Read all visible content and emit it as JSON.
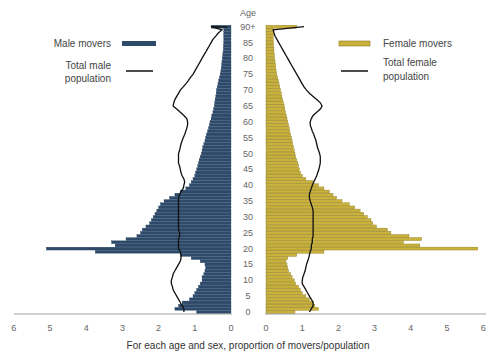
{
  "chart_data": {
    "type": "bar",
    "subtype": "population-pyramid",
    "title": "",
    "ylabel": "Age",
    "xlabel": "For each age and sex, proportion of movers/population",
    "age_ticks": [
      "0",
      "5",
      "10",
      "15",
      "20",
      "25",
      "30",
      "35",
      "40",
      "45",
      "50",
      "55",
      "60",
      "65",
      "70",
      "75",
      "80",
      "85",
      "90+"
    ],
    "x_ticks_left": [
      "6",
      "5",
      "4",
      "3",
      "2",
      "1",
      "0"
    ],
    "x_ticks_right": [
      "0",
      "1",
      "2",
      "3",
      "4",
      "5",
      "6"
    ],
    "xlim": [
      0,
      6
    ],
    "legend": {
      "male_movers": "Male movers",
      "total_male": "Total male population",
      "total_male_line1": "Total male",
      "total_male_line2": "population",
      "female_movers": "Female movers",
      "total_female": "Total female population",
      "total_female_line1": "Total female",
      "total_female_line2": "population"
    },
    "colors": {
      "male": "#2e4a6b",
      "female": "#c9b13c",
      "female_edge": "#8a7a20",
      "line": "#111111",
      "axis": "#888888"
    },
    "ages": [
      0,
      1,
      2,
      3,
      4,
      5,
      6,
      7,
      8,
      9,
      10,
      11,
      12,
      13,
      14,
      15,
      16,
      17,
      18,
      19,
      20,
      21,
      22,
      23,
      24,
      25,
      26,
      27,
      28,
      29,
      30,
      31,
      32,
      33,
      34,
      35,
      36,
      37,
      38,
      39,
      40,
      41,
      42,
      43,
      44,
      45,
      46,
      47,
      48,
      49,
      50,
      51,
      52,
      53,
      54,
      55,
      56,
      57,
      58,
      59,
      60,
      61,
      62,
      63,
      64,
      65,
      66,
      67,
      68,
      69,
      70,
      71,
      72,
      73,
      74,
      75,
      76,
      77,
      78,
      79,
      80,
      81,
      82,
      83,
      84,
      85,
      86,
      87,
      88,
      89,
      90
    ],
    "series": [
      {
        "name": "Male movers",
        "values": [
          0.95,
          1.55,
          1.45,
          1.35,
          1.15,
          1.05,
          1.0,
          0.95,
          0.9,
          0.85,
          0.8,
          0.8,
          0.75,
          0.72,
          0.7,
          0.72,
          0.85,
          1.1,
          1.4,
          3.75,
          5.1,
          3.2,
          3.3,
          2.9,
          2.6,
          2.5,
          2.45,
          2.35,
          2.25,
          2.2,
          2.15,
          2.1,
          2.05,
          2.0,
          1.95,
          1.85,
          1.7,
          1.55,
          1.4,
          1.25,
          1.15,
          1.1,
          1.05,
          1.0,
          0.98,
          0.95,
          0.92,
          0.9,
          0.88,
          0.85,
          0.82,
          0.8,
          0.78,
          0.75,
          0.72,
          0.7,
          0.68,
          0.65,
          0.62,
          0.6,
          0.58,
          0.55,
          0.53,
          0.5,
          0.48,
          0.46,
          0.45,
          0.44,
          0.42,
          0.41,
          0.4,
          0.38,
          0.36,
          0.34,
          0.32,
          0.3,
          0.28,
          0.27,
          0.26,
          0.25,
          0.24,
          0.23,
          0.22,
          0.21,
          0.21,
          0.2,
          0.2,
          0.2,
          0.2,
          0.2,
          0.55
        ]
      },
      {
        "name": "Female movers",
        "values": [
          0.8,
          1.45,
          1.35,
          1.3,
          1.2,
          1.1,
          1.0,
          0.95,
          0.9,
          0.82,
          0.78,
          0.72,
          0.68,
          0.62,
          0.6,
          0.58,
          0.55,
          0.6,
          0.85,
          1.6,
          5.85,
          4.25,
          3.8,
          4.3,
          3.95,
          3.45,
          3.35,
          3.05,
          2.95,
          2.9,
          2.8,
          2.7,
          2.6,
          2.45,
          2.3,
          2.1,
          1.95,
          1.85,
          1.75,
          1.6,
          1.45,
          1.3,
          1.1,
          1.0,
          0.95,
          0.92,
          0.9,
          0.88,
          0.85,
          0.82,
          0.8,
          0.78,
          0.76,
          0.74,
          0.72,
          0.7,
          0.68,
          0.66,
          0.64,
          0.62,
          0.6,
          0.58,
          0.56,
          0.54,
          0.52,
          0.5,
          0.48,
          0.46,
          0.44,
          0.42,
          0.4,
          0.38,
          0.36,
          0.34,
          0.32,
          0.3,
          0.28,
          0.27,
          0.26,
          0.25,
          0.24,
          0.23,
          0.22,
          0.22,
          0.21,
          0.21,
          0.2,
          0.2,
          0.2,
          0.2,
          0.85
        ]
      },
      {
        "name": "Total male population",
        "type": "line",
        "values": [
          1.3,
          1.3,
          1.35,
          1.4,
          1.45,
          1.5,
          1.55,
          1.6,
          1.62,
          1.65,
          1.65,
          1.62,
          1.6,
          1.55,
          1.5,
          1.45,
          1.4,
          1.38,
          1.38,
          1.4,
          1.45,
          1.45,
          1.45,
          1.45,
          1.42,
          1.42,
          1.45,
          1.45,
          1.45,
          1.45,
          1.45,
          1.45,
          1.45,
          1.45,
          1.45,
          1.45,
          1.45,
          1.42,
          1.38,
          1.32,
          1.3,
          1.28,
          1.3,
          1.35,
          1.38,
          1.4,
          1.42,
          1.45,
          1.45,
          1.45,
          1.45,
          1.42,
          1.4,
          1.38,
          1.35,
          1.32,
          1.28,
          1.25,
          1.22,
          1.2,
          1.2,
          1.22,
          1.3,
          1.4,
          1.5,
          1.6,
          1.58,
          1.55,
          1.5,
          1.45,
          1.4,
          1.32,
          1.25,
          1.18,
          1.12,
          1.05,
          1.0,
          0.95,
          0.9,
          0.85,
          0.8,
          0.75,
          0.7,
          0.65,
          0.6,
          0.55,
          0.5,
          0.42,
          0.35,
          0.25,
          0.55
        ]
      },
      {
        "name": "Total female population",
        "type": "line",
        "values": [
          1.2,
          1.25,
          1.3,
          1.3,
          1.25,
          1.2,
          1.15,
          1.1,
          1.05,
          1.0,
          1.0,
          1.02,
          1.05,
          1.08,
          1.1,
          1.12,
          1.15,
          1.18,
          1.2,
          1.22,
          1.25,
          1.25,
          1.28,
          1.28,
          1.3,
          1.3,
          1.3,
          1.3,
          1.3,
          1.3,
          1.3,
          1.3,
          1.3,
          1.28,
          1.25,
          1.22,
          1.2,
          1.2,
          1.22,
          1.25,
          1.28,
          1.32,
          1.36,
          1.4,
          1.43,
          1.46,
          1.48,
          1.5,
          1.5,
          1.5,
          1.48,
          1.45,
          1.42,
          1.4,
          1.38,
          1.35,
          1.32,
          1.28,
          1.25,
          1.22,
          1.22,
          1.25,
          1.3,
          1.4,
          1.5,
          1.55,
          1.5,
          1.4,
          1.3,
          1.2,
          1.12,
          1.05,
          1.0,
          0.95,
          0.9,
          0.85,
          0.8,
          0.75,
          0.7,
          0.65,
          0.6,
          0.55,
          0.5,
          0.45,
          0.4,
          0.35,
          0.3,
          0.25,
          0.22,
          0.2,
          1.05
        ]
      }
    ]
  }
}
